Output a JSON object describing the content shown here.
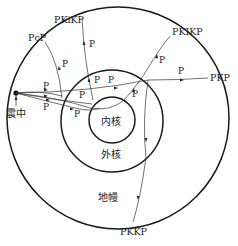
{
  "layers": {
    "inner_core": "内核",
    "outer_core": "外核",
    "mantle": "地幔"
  },
  "focus": {
    "label": "震中"
  },
  "phases": {
    "pcp": "PcP",
    "pkikp_top": "PKiKP",
    "pkikp_right": "PKIKP",
    "pkp": "PKP",
    "pkkp": "PKKP"
  },
  "segment_label": "P",
  "colors": {
    "line": "#1a1a1a",
    "text": "#222222",
    "background": "#ffffff"
  }
}
